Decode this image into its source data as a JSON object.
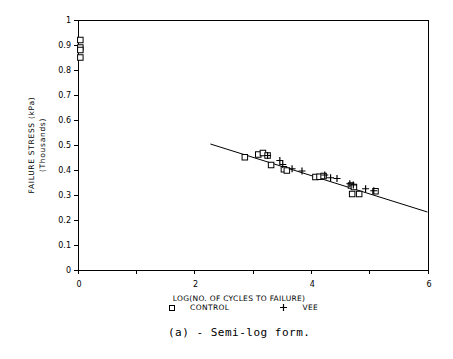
{
  "caption": "(a) - Semi-log form.",
  "colors": {
    "ink": "#000000",
    "background": "#ffffff"
  },
  "chart_data": {
    "type": "scatter",
    "title": "",
    "xlabel": "LOG(NO. OF CYCLES TO FAILURE)",
    "ylabel_line1": "FAILURE STRESS (kPa)",
    "ylabel_line2": "(Thousands)",
    "xlim": [
      0,
      6
    ],
    "ylim": [
      0,
      1
    ],
    "grid": false,
    "legend_position": "bottom",
    "x_ticks": [
      {
        "value": 0,
        "label": "0"
      },
      {
        "value": 1,
        "label": ""
      },
      {
        "value": 2,
        "label": "2"
      },
      {
        "value": 3,
        "label": ""
      },
      {
        "value": 4,
        "label": "4"
      },
      {
        "value": 5,
        "label": ""
      },
      {
        "value": 6,
        "label": "6"
      }
    ],
    "y_ticks": [
      {
        "value": 1,
        "label": "1"
      },
      {
        "value": 0.9,
        "label": "0.9"
      },
      {
        "value": 0.8,
        "label": "0.8"
      },
      {
        "value": 0.7,
        "label": "0.7"
      },
      {
        "value": 0.6,
        "label": "0.6"
      },
      {
        "value": 0.5,
        "label": "0.5"
      },
      {
        "value": 0.4,
        "label": "0.4"
      },
      {
        "value": 0.3,
        "label": "0.3"
      },
      {
        "value": 0.2,
        "label": "0.2"
      },
      {
        "value": 0.1,
        "label": "0.1"
      },
      {
        "value": 0,
        "label": "0"
      }
    ],
    "series": [
      {
        "name": "CONTROL",
        "marker": "square",
        "points": [
          [
            0.04,
            0.92
          ],
          [
            0.04,
            0.89
          ],
          [
            0.04,
            0.88
          ],
          [
            0.04,
            0.85
          ],
          [
            2.86,
            0.451
          ],
          [
            3.09,
            0.462
          ],
          [
            3.17,
            0.468
          ],
          [
            3.25,
            0.458
          ],
          [
            3.31,
            0.42
          ],
          [
            3.53,
            0.403
          ],
          [
            3.58,
            0.398
          ],
          [
            4.07,
            0.372
          ],
          [
            4.14,
            0.373
          ],
          [
            4.21,
            0.376
          ],
          [
            4.68,
            0.338
          ],
          [
            4.73,
            0.332
          ],
          [
            4.7,
            0.304
          ],
          [
            4.82,
            0.304
          ],
          [
            5.1,
            0.315
          ]
        ]
      },
      {
        "name": "VEE",
        "marker": "plus",
        "points": [
          [
            3.25,
            0.458
          ],
          [
            3.46,
            0.438
          ],
          [
            3.51,
            0.422
          ],
          [
            3.67,
            0.405
          ],
          [
            3.84,
            0.396
          ],
          [
            4.23,
            0.38
          ],
          [
            4.33,
            0.369
          ],
          [
            4.44,
            0.366
          ],
          [
            4.66,
            0.345
          ],
          [
            4.72,
            0.34
          ],
          [
            4.93,
            0.325
          ],
          [
            5.07,
            0.317
          ]
        ]
      }
    ],
    "fit_line": {
      "x_start": 2.27,
      "y_start": 0.504,
      "x_end": 5.99,
      "y_end": 0.232
    }
  }
}
